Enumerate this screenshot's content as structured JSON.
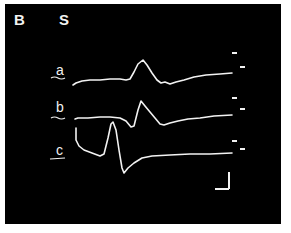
{
  "figure": {
    "panel_label": "B",
    "column_label": "S",
    "background_color": "#000000",
    "trace_color": "#f2f2f2",
    "traces": [
      {
        "label": "a",
        "label_x": 56,
        "label_y": 76,
        "points": "73,85 76,83 82,81 90,80 100,80 110,79 120,79 126,80 130,79 134,72 138,64 143,60 147,65 152,73 157,80 161,83 165,82 170,84 176,82 184,80 194,77 206,75 220,74 232,73"
      },
      {
        "label": "b",
        "label_x": 56,
        "label_y": 113,
        "points": "75,119 78,118 88,118 100,117 110,117 120,118 126,121 131,127 134,126 138,110 141,101 145,106 150,112 155,118 160,124 164,125 170,123 178,121 188,119 200,118 214,116 232,115"
      },
      {
        "label": "c",
        "label_x": 56,
        "label_y": 156,
        "points": "76,128 76,140 79,146 84,150 92,153 100,156 104,154 108,138 111,124 113,122 116,130 119,150 122,168 124,173 128,168 134,163 142,158 152,156 170,155 190,154 210,154 232,153"
      }
    ],
    "trace_label_underlines": [
      {
        "x1": 51,
        "y1": 78,
        "x2": 65,
        "y2": 78,
        "squiggle": true
      },
      {
        "x1": 51,
        "y1": 118,
        "x2": 65,
        "y2": 118,
        "squiggle": true
      },
      {
        "x1": 50,
        "y1": 159,
        "x2": 65,
        "y2": 158,
        "squiggle": false
      }
    ],
    "markers": [
      {
        "x1": 232,
        "y1": 53,
        "x2": 237,
        "y2": 53
      },
      {
        "x1": 240,
        "y1": 67,
        "x2": 245,
        "y2": 67
      },
      {
        "x1": 232,
        "y1": 98,
        "x2": 237,
        "y2": 98
      },
      {
        "x1": 240,
        "y1": 109,
        "x2": 245,
        "y2": 109
      },
      {
        "x1": 232,
        "y1": 141,
        "x2": 237,
        "y2": 141
      },
      {
        "x1": 240,
        "y1": 149,
        "x2": 245,
        "y2": 149
      }
    ],
    "scale_bar": {
      "vertical": {
        "x": 229,
        "y1": 172,
        "y2": 189
      },
      "horizontal": {
        "y": 189,
        "x1": 215,
        "x2": 229
      }
    }
  }
}
